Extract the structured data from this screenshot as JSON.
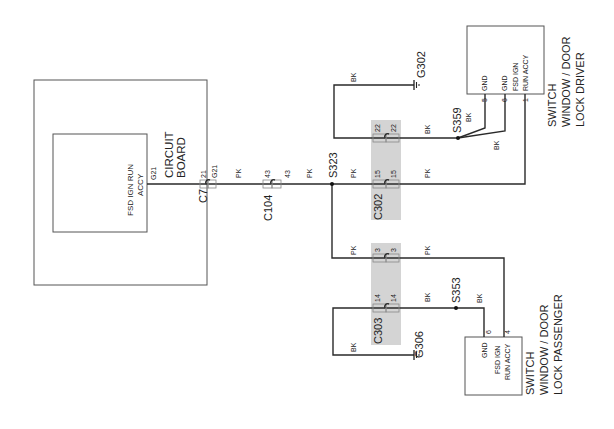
{
  "diagram": {
    "orientation": "rotated 90deg counter-clockwise",
    "components": {
      "circuit_board": {
        "title_line1": "CIRCUIT",
        "title_line2": "BOARD",
        "inner_label_line1": "FSD IGN RUN",
        "inner_label_line2": "ACCY",
        "pin": "G21"
      },
      "driver_switch": {
        "title_line1": "SWITCH",
        "title_line2": "WINDOW / DOOR",
        "title_line3": "LOCK DRIVER",
        "pins": [
          {
            "label": "GND",
            "number": "5"
          },
          {
            "label": "GND",
            "number": "6"
          },
          {
            "label_line1": "FSD IGN",
            "label_line2": "RUN ACCY",
            "number": "1"
          }
        ]
      },
      "passenger_switch": {
        "title_line1": "SWITCH",
        "title_line2": "WINDOW / DOOR",
        "title_line3": "LOCK PASSENGER",
        "pins": [
          {
            "label": "GND",
            "number": "6"
          },
          {
            "label_line1": "FSD IGN",
            "label_line2": "RUN ACCY",
            "number": "4"
          }
        ]
      }
    },
    "connectors": {
      "c7": {
        "name": "C7",
        "pin_a": "21",
        "pin_b": "G21"
      },
      "c104": {
        "name": "C104",
        "pin_a": "43",
        "pin_b": "43"
      },
      "c302": {
        "name": "C302",
        "pin_22a": "22",
        "pin_22b": "22",
        "pin_15a": "15",
        "pin_15b": "15"
      },
      "c303": {
        "name": "C303",
        "pin_3a": "3",
        "pin_3b": "3",
        "pin_14a": "14",
        "pin_14b": "14"
      }
    },
    "splices": {
      "s323": "S323",
      "s359": "S359",
      "s353": "S353"
    },
    "grounds": {
      "g302": "G302",
      "g306": "G306"
    },
    "wire_colors": {
      "pk": "PK",
      "bk": "BK"
    },
    "colors": {
      "wire": "#2a2a2a",
      "connector_shade": "#d4d4d4",
      "box_border": "#555555"
    }
  }
}
